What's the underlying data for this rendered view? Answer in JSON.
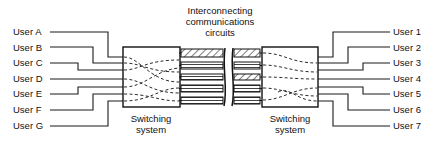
{
  "figure": {
    "title": {
      "line1": "Interconnecting",
      "line2": "communications",
      "line3": "circuits"
    },
    "left_users": [
      {
        "label": "User A"
      },
      {
        "label": "User B"
      },
      {
        "label": "User C"
      },
      {
        "label": "User D"
      },
      {
        "label": "User E"
      },
      {
        "label": "User F"
      },
      {
        "label": "User G"
      }
    ],
    "right_users": [
      {
        "label": "User 1"
      },
      {
        "label": "User 2"
      },
      {
        "label": "User 3"
      },
      {
        "label": "User 4"
      },
      {
        "label": "User 5"
      },
      {
        "label": "User 6"
      },
      {
        "label": "User 7"
      }
    ],
    "left_box": {
      "label_line1": "Switching",
      "label_line2": "system"
    },
    "right_box": {
      "label_line1": "Switching",
      "label_line2": "system"
    },
    "colors": {
      "line": "#111111",
      "dashed_connection": "#2a2a2a",
      "background": "#ffffff",
      "hatch": "#111111"
    },
    "trunk_count": 5,
    "hatched_trunk_indices": [
      0,
      3
    ]
  }
}
